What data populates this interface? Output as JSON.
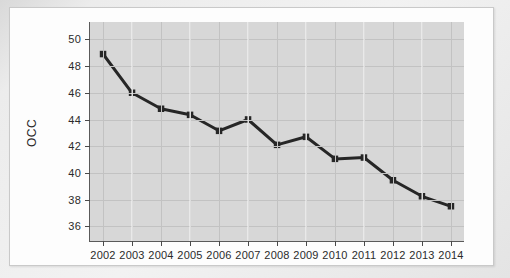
{
  "figure": {
    "background_color": "#fdfdfd",
    "plot_background_color": "#d7d7d7",
    "page_background_color": "#e3e3e3"
  },
  "axis_title_y": "OCC",
  "chart_data": {
    "type": "line",
    "title": "",
    "xlabel": "",
    "ylabel": "OCC",
    "categories": [
      "2002",
      "2003",
      "2004",
      "2005",
      "2006",
      "2007",
      "2008",
      "2009",
      "2010",
      "2011",
      "2012",
      "2013",
      "2014"
    ],
    "x": [
      2002,
      2003,
      2004,
      2005,
      2006,
      2007,
      2008,
      2009,
      2010,
      2011,
      2012,
      2013,
      2014
    ],
    "values": [
      48.9,
      46.0,
      44.8,
      44.35,
      43.15,
      44.0,
      42.1,
      42.7,
      41.05,
      41.15,
      39.45,
      38.25,
      37.5
    ],
    "series": [
      {
        "name": "OCC",
        "values": [
          48.9,
          46.0,
          44.8,
          44.35,
          43.15,
          44.0,
          42.1,
          42.7,
          41.05,
          41.15,
          39.45,
          38.25,
          37.5
        ],
        "color": "#262626",
        "marker": "square",
        "line_width": 3
      }
    ],
    "ylim": [
      34.9,
      51.3
    ],
    "yticks": [
      36,
      38,
      40,
      42,
      44,
      46,
      48,
      50
    ],
    "ytick_labels": [
      "36",
      "38",
      "40",
      "42",
      "44",
      "46",
      "48",
      "50"
    ],
    "xticks": [
      2002,
      2003,
      2004,
      2005,
      2006,
      2007,
      2008,
      2009,
      2010,
      2011,
      2012,
      2013,
      2014
    ],
    "xtick_labels": [
      "2002",
      "2003",
      "2004",
      "2005",
      "2006",
      "2007",
      "2008",
      "2009",
      "2010",
      "2011",
      "2012",
      "2013",
      "2014"
    ],
    "xlim": [
      2001.55,
      2014.45
    ],
    "grid": true,
    "grid_color": "#c2c2c2",
    "legend": null,
    "legend_position": "none",
    "annotations": []
  }
}
